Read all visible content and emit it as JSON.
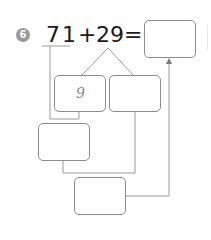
{
  "problem": {
    "number": "6",
    "left_operand_tens": "7",
    "left_operand_ones": "1",
    "operator": "+",
    "right_operand": "29",
    "equals": "="
  },
  "boxes": {
    "answer": "",
    "split_left": "9",
    "split_right": "",
    "middle_left": "",
    "bottom": ""
  },
  "colors": {
    "line": "#9a9a9a",
    "box_border": "#8a8a8a",
    "badge": "#9a9a9a",
    "text": "#1a1a1a"
  }
}
